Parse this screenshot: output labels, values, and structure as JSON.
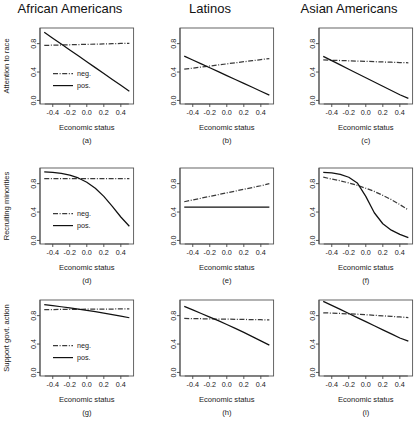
{
  "figure": {
    "columns": [
      {
        "id": "african-americans",
        "title": "African Americans"
      },
      {
        "id": "latinos",
        "title": "Latinos"
      },
      {
        "id": "asian-americans",
        "title": "Asian Americans"
      }
    ],
    "row_ylabels": [
      "Attention to race",
      "Recruiting minorities",
      "Support govt. action"
    ],
    "xlabel": "Economic status",
    "legend": {
      "neg_label": "neg.",
      "pos_label": "pos."
    },
    "colors": {
      "pos_line": "#111111",
      "neg_line": "#3a3a3a",
      "axis": "#444444",
      "frame": "#555555"
    }
  },
  "chart_data": [
    {
      "type": "line",
      "panel": "(a)",
      "title": "African Americans",
      "xlabel": "Economic status",
      "ylabel": "Attention to race",
      "xlim": [
        -0.55,
        0.55
      ],
      "ylim": [
        -0.05,
        1.02
      ],
      "xticks": [
        -0.4,
        -0.2,
        0.0,
        0.2,
        0.4
      ],
      "xticklabels": [
        "-0.4",
        "-0.2",
        "0.0",
        "0.2",
        "0.4"
      ],
      "yticks": [
        0.0,
        0.4,
        0.8
      ],
      "yticklabels": [
        "0.0",
        "0.4",
        "0.8"
      ],
      "grid": false,
      "legend": true,
      "legend_position": "center-left",
      "series": [
        {
          "name": "neg.",
          "style": "dashdot",
          "x": [
            -0.5,
            -0.4,
            -0.3,
            -0.2,
            -0.1,
            0.0,
            0.1,
            0.2,
            0.3,
            0.4,
            0.5
          ],
          "values": [
            0.775,
            0.778,
            0.781,
            0.784,
            0.787,
            0.79,
            0.793,
            0.796,
            0.799,
            0.802,
            0.805
          ]
        },
        {
          "name": "pos.",
          "style": "solid",
          "x": [
            -0.5,
            -0.4,
            -0.3,
            -0.2,
            -0.1,
            0.0,
            0.1,
            0.2,
            0.3,
            0.4,
            0.5
          ],
          "values": [
            0.96,
            0.877,
            0.794,
            0.711,
            0.628,
            0.545,
            0.462,
            0.379,
            0.296,
            0.213,
            0.13
          ]
        }
      ]
    },
    {
      "type": "line",
      "panel": "(b)",
      "title": "Latinos",
      "xlabel": "Economic status",
      "ylabel": "",
      "xlim": [
        -0.55,
        0.55
      ],
      "ylim": [
        -0.05,
        1.02
      ],
      "xticks": [
        -0.4,
        -0.2,
        0.0,
        0.2,
        0.4
      ],
      "xticklabels": [
        "-0.4",
        "-0.2",
        "0.0",
        "0.2",
        "0.4"
      ],
      "yticks": [
        0.0,
        0.4,
        0.8
      ],
      "yticklabels": [
        "0.0",
        "0.4",
        "0.8"
      ],
      "grid": false,
      "legend": false,
      "series": [
        {
          "name": "neg.",
          "style": "dashdot",
          "x": [
            -0.5,
            -0.4,
            -0.3,
            -0.2,
            -0.1,
            0.0,
            0.1,
            0.2,
            0.3,
            0.4,
            0.5
          ],
          "values": [
            0.44,
            0.455,
            0.47,
            0.485,
            0.5,
            0.515,
            0.53,
            0.545,
            0.56,
            0.575,
            0.59
          ]
        },
        {
          "name": "pos.",
          "style": "solid",
          "x": [
            -0.5,
            -0.4,
            -0.3,
            -0.2,
            -0.1,
            0.0,
            0.1,
            0.2,
            0.3,
            0.4,
            0.5
          ],
          "values": [
            0.625,
            0.57,
            0.515,
            0.46,
            0.405,
            0.35,
            0.295,
            0.24,
            0.185,
            0.13,
            0.075
          ]
        }
      ]
    },
    {
      "type": "line",
      "panel": "(c)",
      "title": "Asian Americans",
      "xlabel": "Economic status",
      "ylabel": "",
      "xlim": [
        -0.55,
        0.55
      ],
      "ylim": [
        -0.05,
        1.02
      ],
      "xticks": [
        -0.4,
        -0.2,
        0.0,
        0.2,
        0.4
      ],
      "xticklabels": [
        "-0.4",
        "-0.2",
        "0.0",
        "0.2",
        "0.4"
      ],
      "yticks": [
        0.0,
        0.4,
        0.8
      ],
      "yticklabels": [
        "0.0",
        "0.4",
        "0.8"
      ],
      "grid": false,
      "legend": false,
      "series": [
        {
          "name": "neg.",
          "style": "dashdot",
          "x": [
            -0.5,
            -0.4,
            -0.3,
            -0.2,
            -0.1,
            0.0,
            0.1,
            0.2,
            0.3,
            0.4,
            0.5
          ],
          "values": [
            0.57,
            0.566,
            0.562,
            0.558,
            0.554,
            0.55,
            0.546,
            0.542,
            0.538,
            0.534,
            0.53
          ]
        },
        {
          "name": "pos.",
          "style": "solid",
          "x": [
            -0.5,
            -0.4,
            -0.3,
            -0.2,
            -0.1,
            0.0,
            0.1,
            0.2,
            0.3,
            0.4,
            0.5
          ],
          "values": [
            0.62,
            0.56,
            0.5,
            0.44,
            0.38,
            0.32,
            0.26,
            0.2,
            0.14,
            0.08,
            0.03
          ]
        }
      ]
    },
    {
      "type": "line",
      "panel": "(d)",
      "title": "African Americans",
      "xlabel": "Economic status",
      "ylabel": "Recruiting minorities",
      "xlim": [
        -0.55,
        0.55
      ],
      "ylim": [
        -0.05,
        1.02
      ],
      "xticks": [
        -0.4,
        -0.2,
        0.0,
        0.2,
        0.4
      ],
      "xticklabels": [
        "-0.4",
        "-0.2",
        "0.0",
        "0.2",
        "0.4"
      ],
      "yticks": [
        0.0,
        0.4,
        0.8
      ],
      "yticklabels": [
        "0.0",
        "0.4",
        "0.8"
      ],
      "grid": false,
      "legend": true,
      "legend_position": "center-left",
      "series": [
        {
          "name": "neg.",
          "style": "dashdot",
          "x": [
            -0.5,
            -0.4,
            -0.3,
            -0.2,
            -0.1,
            0.0,
            0.1,
            0.2,
            0.3,
            0.4,
            0.5
          ],
          "values": [
            0.87,
            0.87,
            0.87,
            0.87,
            0.87,
            0.87,
            0.87,
            0.87,
            0.87,
            0.87,
            0.87
          ]
        },
        {
          "name": "pos.",
          "style": "solid",
          "x": [
            -0.5,
            -0.4,
            -0.3,
            -0.2,
            -0.1,
            0.0,
            0.1,
            0.2,
            0.3,
            0.4,
            0.5
          ],
          "values": [
            0.965,
            0.96,
            0.945,
            0.92,
            0.88,
            0.82,
            0.735,
            0.62,
            0.48,
            0.33,
            0.2
          ]
        }
      ]
    },
    {
      "type": "line",
      "panel": "(e)",
      "title": "Latinos",
      "xlabel": "Economic status",
      "ylabel": "",
      "xlim": [
        -0.55,
        0.55
      ],
      "ylim": [
        -0.05,
        1.02
      ],
      "xticks": [
        -0.4,
        -0.2,
        0.0,
        0.2,
        0.4
      ],
      "xticklabels": [
        "-0.4",
        "-0.2",
        "0.0",
        "0.2",
        "0.4"
      ],
      "yticks": [
        0.0,
        0.4,
        0.8
      ],
      "yticklabels": [
        "0.0",
        "0.4",
        "0.8"
      ],
      "grid": false,
      "legend": false,
      "series": [
        {
          "name": "neg.",
          "style": "dashdot",
          "x": [
            -0.5,
            -0.4,
            -0.3,
            -0.2,
            -0.1,
            0.0,
            0.1,
            0.2,
            0.3,
            0.4,
            0.5
          ],
          "values": [
            0.545,
            0.57,
            0.595,
            0.62,
            0.645,
            0.67,
            0.695,
            0.72,
            0.745,
            0.77,
            0.8
          ]
        },
        {
          "name": "pos.",
          "style": "solid",
          "x": [
            -0.5,
            -0.4,
            -0.3,
            -0.2,
            -0.1,
            0.0,
            0.1,
            0.2,
            0.3,
            0.4,
            0.5
          ],
          "values": [
            0.47,
            0.47,
            0.47,
            0.47,
            0.47,
            0.47,
            0.47,
            0.47,
            0.47,
            0.47,
            0.47
          ]
        }
      ]
    },
    {
      "type": "line",
      "panel": "(f)",
      "title": "Asian Americans",
      "xlabel": "Economic status",
      "ylabel": "",
      "xlim": [
        -0.55,
        0.55
      ],
      "ylim": [
        -0.05,
        1.02
      ],
      "xticks": [
        -0.4,
        -0.2,
        0.0,
        0.2,
        0.4
      ],
      "xticklabels": [
        "-0.4",
        "-0.2",
        "0.0",
        "0.2",
        "0.4"
      ],
      "yticks": [
        0.0,
        0.4,
        0.8
      ],
      "yticklabels": [
        "0.0",
        "0.4",
        "0.8"
      ],
      "grid": false,
      "legend": false,
      "series": [
        {
          "name": "neg.",
          "style": "dashdot",
          "x": [
            -0.5,
            -0.4,
            -0.3,
            -0.2,
            -0.1,
            0.0,
            0.1,
            0.2,
            0.3,
            0.4,
            0.5
          ],
          "values": [
            0.89,
            0.865,
            0.84,
            0.81,
            0.775,
            0.735,
            0.69,
            0.635,
            0.575,
            0.505,
            0.43
          ]
        },
        {
          "name": "pos.",
          "style": "solid",
          "x": [
            -0.5,
            -0.4,
            -0.3,
            -0.2,
            -0.1,
            0.0,
            0.1,
            0.2,
            0.3,
            0.4,
            0.5
          ],
          "values": [
            0.96,
            0.95,
            0.93,
            0.89,
            0.81,
            0.62,
            0.39,
            0.235,
            0.145,
            0.085,
            0.04
          ]
        }
      ]
    },
    {
      "type": "line",
      "panel": "(g)",
      "title": "African Americans",
      "xlabel": "Economic status",
      "ylabel": "Support govt. action",
      "xlim": [
        -0.55,
        0.55
      ],
      "ylim": [
        -0.05,
        1.02
      ],
      "xticks": [
        -0.4,
        -0.2,
        0.0,
        0.2,
        0.4
      ],
      "xticklabels": [
        "-0.4",
        "-0.2",
        "0.0",
        "0.2",
        "0.4"
      ],
      "yticks": [
        0.0,
        0.4,
        0.8
      ],
      "yticklabels": [
        "0.0",
        "0.4",
        "0.8"
      ],
      "grid": false,
      "legend": true,
      "legend_position": "center-left",
      "series": [
        {
          "name": "neg.",
          "style": "dashdot",
          "x": [
            -0.5,
            -0.4,
            -0.3,
            -0.2,
            -0.1,
            0.0,
            0.1,
            0.2,
            0.3,
            0.4,
            0.5
          ],
          "values": [
            0.885,
            0.886,
            0.887,
            0.888,
            0.889,
            0.89,
            0.891,
            0.892,
            0.893,
            0.894,
            0.895
          ]
        },
        {
          "name": "pos.",
          "style": "solid",
          "x": [
            -0.5,
            -0.4,
            -0.3,
            -0.2,
            -0.1,
            0.0,
            0.1,
            0.2,
            0.3,
            0.4,
            0.5
          ],
          "values": [
            0.955,
            0.94,
            0.925,
            0.91,
            0.893,
            0.875,
            0.855,
            0.835,
            0.815,
            0.793,
            0.77
          ]
        }
      ]
    },
    {
      "type": "line",
      "panel": "(h)",
      "title": "Latinos",
      "xlabel": "Economic status",
      "ylabel": "",
      "xlim": [
        -0.55,
        0.55
      ],
      "ylim": [
        -0.05,
        1.02
      ],
      "xticks": [
        -0.4,
        -0.2,
        0.0,
        0.2,
        0.4
      ],
      "xticklabels": [
        "-0.4",
        "-0.2",
        "0.0",
        "0.2",
        "0.4"
      ],
      "yticks": [
        0.0,
        0.4,
        0.8
      ],
      "yticklabels": [
        "0.0",
        "0.4",
        "0.8"
      ],
      "grid": false,
      "legend": false,
      "series": [
        {
          "name": "neg.",
          "style": "dashdot",
          "x": [
            -0.5,
            -0.4,
            -0.3,
            -0.2,
            -0.1,
            0.0,
            0.1,
            0.2,
            0.3,
            0.4,
            0.5
          ],
          "values": [
            0.76,
            0.758,
            0.756,
            0.754,
            0.752,
            0.75,
            0.748,
            0.746,
            0.744,
            0.742,
            0.74
          ]
        },
        {
          "name": "pos.",
          "style": "solid",
          "x": [
            -0.5,
            -0.4,
            -0.3,
            -0.2,
            -0.1,
            0.0,
            0.1,
            0.2,
            0.3,
            0.4,
            0.5
          ],
          "values": [
            0.93,
            0.88,
            0.83,
            0.78,
            0.73,
            0.675,
            0.62,
            0.565,
            0.505,
            0.445,
            0.385
          ]
        }
      ]
    },
    {
      "type": "line",
      "panel": "(i)",
      "title": "Asian Americans",
      "xlabel": "Economic status",
      "ylabel": "",
      "xlim": [
        -0.55,
        0.55
      ],
      "ylim": [
        -0.05,
        1.02
      ],
      "xticks": [
        -0.4,
        -0.2,
        0.0,
        0.2,
        0.4
      ],
      "xticklabels": [
        "-0.4",
        "-0.2",
        "0.0",
        "0.2",
        "0.4"
      ],
      "yticks": [
        0.0,
        0.4,
        0.8
      ],
      "yticklabels": [
        "0.0",
        "0.4",
        "0.8"
      ],
      "grid": false,
      "legend": false,
      "series": [
        {
          "name": "neg.",
          "style": "dashdot",
          "x": [
            -0.5,
            -0.4,
            -0.3,
            -0.2,
            -0.1,
            0.0,
            0.1,
            0.2,
            0.3,
            0.4,
            0.5
          ],
          "values": [
            0.84,
            0.835,
            0.83,
            0.825,
            0.82,
            0.812,
            0.805,
            0.797,
            0.789,
            0.781,
            0.772
          ]
        },
        {
          "name": "pos.",
          "style": "solid",
          "x": [
            -0.5,
            -0.4,
            -0.3,
            -0.2,
            -0.1,
            0.0,
            0.1,
            0.2,
            0.3,
            0.4,
            0.5
          ],
          "values": [
            1.0,
            0.945,
            0.888,
            0.83,
            0.772,
            0.715,
            0.658,
            0.6,
            0.543,
            0.485,
            0.44
          ]
        }
      ]
    }
  ]
}
